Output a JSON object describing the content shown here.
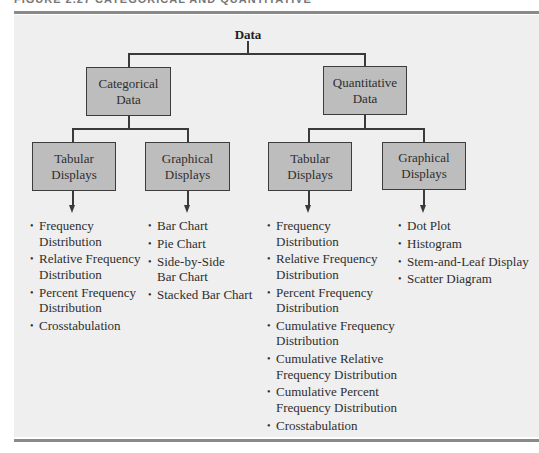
{
  "figure": {
    "caption_partial": "FIGURE 2.27   CATEGORICAL AND QUANTITATIVE"
  },
  "diagram": {
    "root": {
      "label": "Data"
    },
    "categorical": {
      "label_line1": "Categorical",
      "label_line2": "Data",
      "tabular": {
        "label_line1": "Tabular",
        "label_line2": "Displays",
        "items": [
          {
            "line1": "Frequency",
            "line2": "Distribution"
          },
          {
            "line1": "Relative Frequency",
            "line2": "Distribution"
          },
          {
            "line1": "Percent Frequency",
            "line2": "Distribution"
          },
          {
            "line1": "Crosstabulation",
            "line2": ""
          }
        ]
      },
      "graphical": {
        "label_line1": "Graphical",
        "label_line2": "Displays",
        "items": [
          {
            "line1": "Bar Chart",
            "line2": ""
          },
          {
            "line1": "Pie Chart",
            "line2": ""
          },
          {
            "line1": "Side-by-Side",
            "line2": "Bar Chart"
          },
          {
            "line1": "Stacked Bar Chart",
            "line2": ""
          }
        ]
      }
    },
    "quantitative": {
      "label_line1": "Quantitative",
      "label_line2": "Data",
      "tabular": {
        "label_line1": "Tabular",
        "label_line2": "Displays",
        "items": [
          {
            "line1": "Frequency",
            "line2": "Distribution"
          },
          {
            "line1": "Relative Frequency",
            "line2": "Distribution"
          },
          {
            "line1": "Percent Frequency",
            "line2": "Distribution"
          },
          {
            "line1": "Cumulative Frequency",
            "line2": "Distribution"
          },
          {
            "line1": "Cumulative Relative",
            "line2": "Frequency Distribution"
          },
          {
            "line1": "Cumulative Percent",
            "line2": "Frequency Distribution"
          },
          {
            "line1": "Crosstabulation",
            "line2": ""
          }
        ]
      },
      "graphical": {
        "label_line1": "Graphical",
        "label_line2": "Displays",
        "items": [
          {
            "line1": "Dot Plot",
            "line2": ""
          },
          {
            "line1": "Histogram",
            "line2": ""
          },
          {
            "line1": "Stem-and-Leaf Display",
            "line2": ""
          },
          {
            "line1": "Scatter Diagram",
            "line2": ""
          }
        ]
      }
    },
    "bullet_glyph": "•",
    "colors": {
      "box_fill": "#bdbdbd",
      "box_border": "#3c3c3c",
      "panel_bg": "#efefef",
      "rule": "#8a8a8a"
    }
  }
}
